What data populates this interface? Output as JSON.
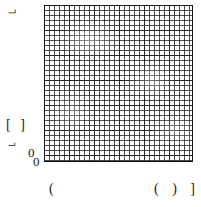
{
  "figure": {
    "width": 201,
    "height": 207,
    "background_color": "#ffffff",
    "ink_color": "#141414"
  },
  "chart_data": {
    "type": "heatmap",
    "title": "",
    "subtitle": "",
    "xlabel": "",
    "ylabel": "",
    "grid": true,
    "legend_position": "none",
    "minor_grid_columns": 30,
    "minor_grid_rows": 31,
    "major_grid_every": 5,
    "minor_cell_px": 5,
    "major_cell_px": 25,
    "x": [],
    "series": [],
    "values": [],
    "categories": [],
    "xlim": [
      0,
      30
    ],
    "ylim": [
      0,
      31
    ],
    "plot_box_px": {
      "left": 44,
      "top": 5,
      "width": 149,
      "height": 157
    },
    "x_tick_labels": [
      "(",
      "( ) ]"
    ],
    "y_tick_labels": [
      "[ ]",
      "U",
      "0"
    ],
    "origin_labels": [
      "0",
      "0"
    ]
  },
  "labels": {
    "ylabel_top": "⌐",
    "ytick_upper": "[ ]",
    "ytick_lower": "⌐",
    "origin_y": "0",
    "origin_x": "0",
    "xtick_left": "(",
    "xtick_right": "( ) ]"
  }
}
